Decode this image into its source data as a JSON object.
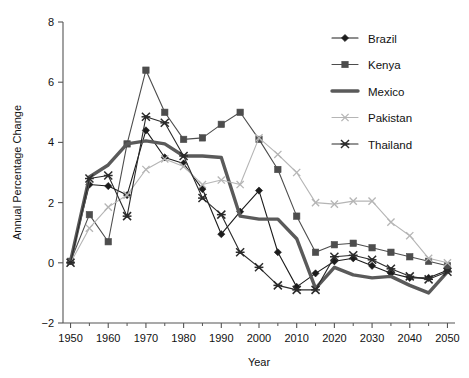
{
  "chart_data": {
    "type": "line",
    "title": "",
    "xlabel": "Year",
    "ylabel": "Annual Percentage Change",
    "xlim": [
      1948,
      2052
    ],
    "ylim": [
      -2,
      8
    ],
    "xticks": [
      1950,
      1960,
      1970,
      1980,
      1990,
      2000,
      2010,
      2020,
      2030,
      2040,
      2050
    ],
    "yticks": [
      -2,
      0,
      2,
      4,
      6,
      8
    ],
    "xtick_labels": [
      "1950",
      "1960",
      "1970",
      "1980",
      "1990",
      "2000",
      "2010",
      "2020",
      "2030",
      "2040",
      "2050"
    ],
    "ytick_labels": [
      "−2",
      "0",
      "2",
      "4",
      "6",
      "8"
    ],
    "grid": false,
    "legend_position": "upper right",
    "x": [
      1950,
      1955,
      1960,
      1965,
      1970,
      1975,
      1980,
      1985,
      1990,
      1995,
      2000,
      2005,
      2010,
      2015,
      2020,
      2025,
      2030,
      2035,
      2040,
      2045,
      2050
    ],
    "series": [
      {
        "name": "Brazil",
        "marker": "diamond",
        "color": "#1c1c1c",
        "linewidth": 1.1,
        "values": [
          0.05,
          2.6,
          2.55,
          2.25,
          4.4,
          3.5,
          3.3,
          2.45,
          0.95,
          1.7,
          2.4,
          0.35,
          -0.8,
          -0.35,
          0.05,
          0.15,
          -0.1,
          -0.35,
          -0.5,
          -0.5,
          -0.25
        ]
      },
      {
        "name": "Kenya",
        "marker": "square",
        "color": "#4d4d4d",
        "linewidth": 1.1,
        "values": [
          0.05,
          1.6,
          0.7,
          3.95,
          6.4,
          5.0,
          4.1,
          4.15,
          4.6,
          5.0,
          4.1,
          3.1,
          1.55,
          0.35,
          0.6,
          0.65,
          0.5,
          0.35,
          0.2,
          0.05,
          -0.1
        ]
      },
      {
        "name": "Mexico",
        "marker": "thick",
        "color": "#5a5a5a",
        "linewidth": 3.4,
        "values": [
          0.05,
          2.85,
          3.25,
          3.95,
          4.05,
          3.95,
          3.55,
          3.55,
          3.5,
          1.55,
          1.45,
          1.45,
          0.8,
          -0.85,
          -0.15,
          -0.4,
          -0.5,
          -0.45,
          -0.75,
          -1.0,
          -0.3
        ]
      },
      {
        "name": "Pakistan",
        "marker": "x",
        "color": "#b5b5b5",
        "linewidth": 1.1,
        "values": [
          0.0,
          1.15,
          1.85,
          2.25,
          3.1,
          3.45,
          3.2,
          2.6,
          2.75,
          2.6,
          4.15,
          3.6,
          3.0,
          2.0,
          1.95,
          2.05,
          2.05,
          1.35,
          0.9,
          0.15,
          0.0
        ]
      },
      {
        "name": "Thailand",
        "marker": "star",
        "color": "#2b2b2b",
        "linewidth": 1.1,
        "values": [
          0.0,
          2.8,
          2.9,
          1.55,
          4.85,
          4.65,
          3.55,
          2.15,
          1.6,
          0.35,
          -0.15,
          -0.75,
          -0.9,
          -0.9,
          0.2,
          0.25,
          0.1,
          -0.2,
          -0.45,
          -0.55,
          -0.3
        ]
      }
    ]
  },
  "legend": {
    "items": [
      {
        "label": "Brazil"
      },
      {
        "label": "Kenya"
      },
      {
        "label": "Mexico"
      },
      {
        "label": "Pakistan"
      },
      {
        "label": "Thailand"
      }
    ]
  }
}
